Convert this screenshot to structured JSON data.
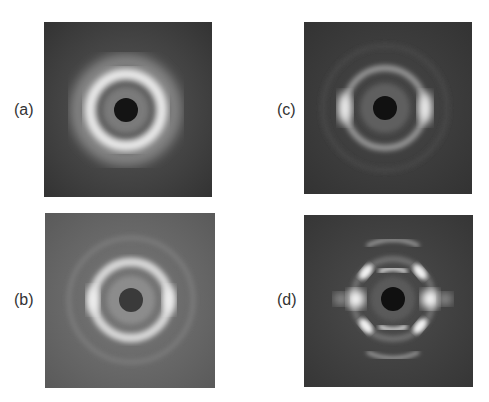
{
  "figure": {
    "header_fragment": "· · ·",
    "panels": [
      {
        "id": "a",
        "label": "(a)",
        "description": "isotropic diffraction ring",
        "background": "#3a3a3a"
      },
      {
        "id": "b",
        "label": "(b)",
        "description": "ring with weak equatorial intensification",
        "background": "#5e5e5e"
      },
      {
        "id": "c",
        "label": "(c)",
        "description": "ring with equatorial arcs",
        "background": "#383838"
      },
      {
        "id": "d",
        "label": "(d)",
        "description": "highly oriented pattern with meridional and off-axis reflections",
        "background": "#3c3c3c"
      }
    ]
  }
}
